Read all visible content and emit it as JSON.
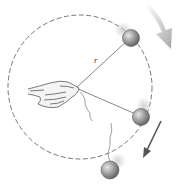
{
  "diagram": {
    "labels": {
      "radius": "r"
    },
    "elements": [
      {
        "id": "path-circle",
        "kind": "dashed-circle"
      },
      {
        "id": "hand",
        "kind": "hand-holding-string"
      },
      {
        "id": "ball-top",
        "kind": "ball-on-string"
      },
      {
        "id": "ball-right",
        "kind": "ball-on-string"
      },
      {
        "id": "ball-released",
        "kind": "ball-broken-string"
      },
      {
        "id": "rotation-arrow",
        "kind": "curved-arrow",
        "direction": "clockwise"
      },
      {
        "id": "tangent-arrow",
        "kind": "straight-arrow",
        "direction": "down-left"
      }
    ],
    "colors": {
      "line": "#555555",
      "ball": "#8a8a8a",
      "arrow_light": "#b8b8b8",
      "arrow_dark": "#555555"
    }
  }
}
